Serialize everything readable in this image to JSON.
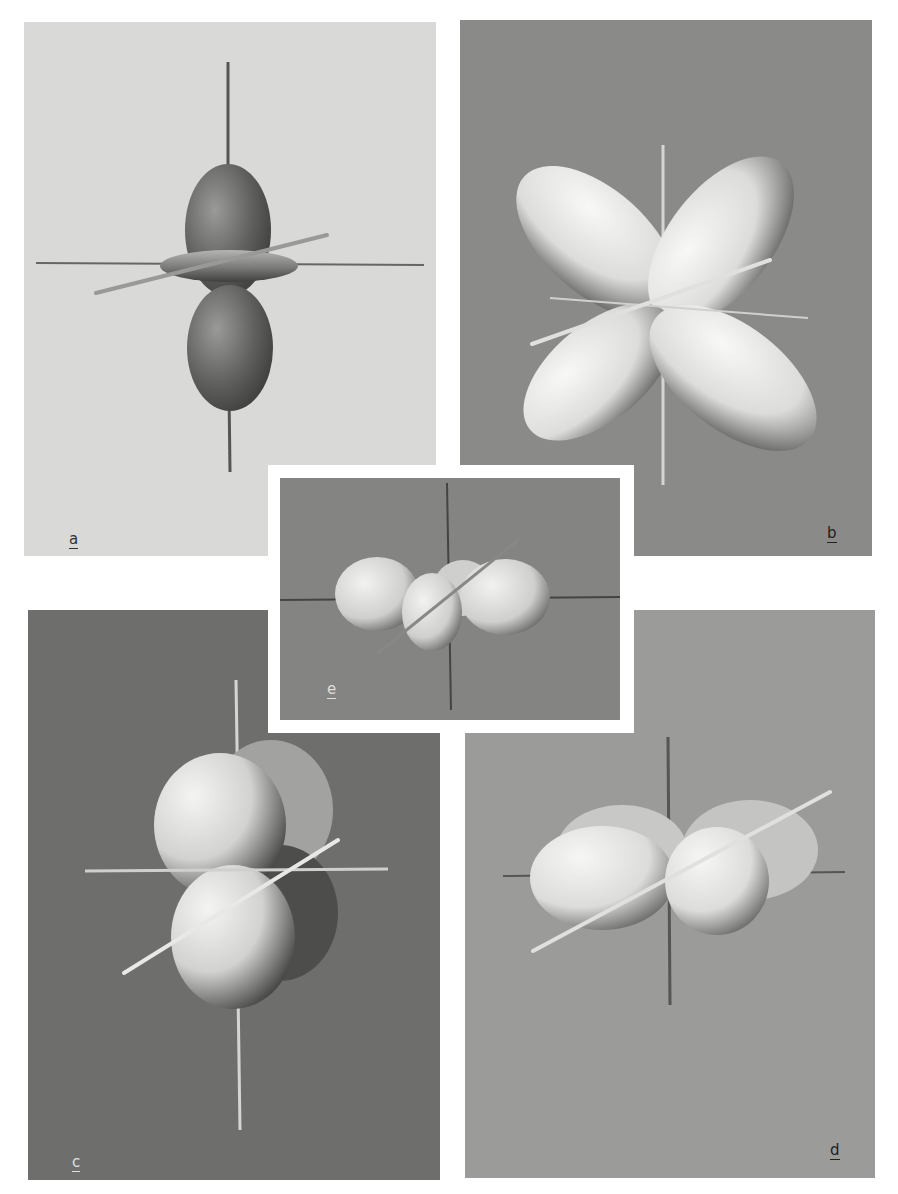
{
  "figure": {
    "panels": [
      {
        "id": "a",
        "label": "a",
        "shape": "dz2 orbital: two dumbbell lobes along vertical axis with a torus ring in the equatorial plane",
        "background": "#d9d9d7",
        "lobe_color": "#6a6a68"
      },
      {
        "id": "b",
        "label": "b",
        "shape": "cloverleaf: four lobes between the axes",
        "background": "#8a8a88",
        "lobe_color": "#eeeeec"
      },
      {
        "id": "c",
        "label": "c",
        "shape": "four lobes in tilted plane containing vertical axis",
        "background": "#6e6e6c",
        "lobe_color": "#e6e6e4"
      },
      {
        "id": "d",
        "label": "d",
        "shape": "four lobes in horizontal plane, viewed obliquely",
        "background": "#9b9b99",
        "lobe_color": "#e8e8e6"
      },
      {
        "id": "e",
        "label": "e",
        "shape": "four lobes lying in horizontal plane, viewed from front (inset)",
        "background": "#848482",
        "lobe_color": "#dededc"
      }
    ],
    "page_background": "#ffffff"
  }
}
